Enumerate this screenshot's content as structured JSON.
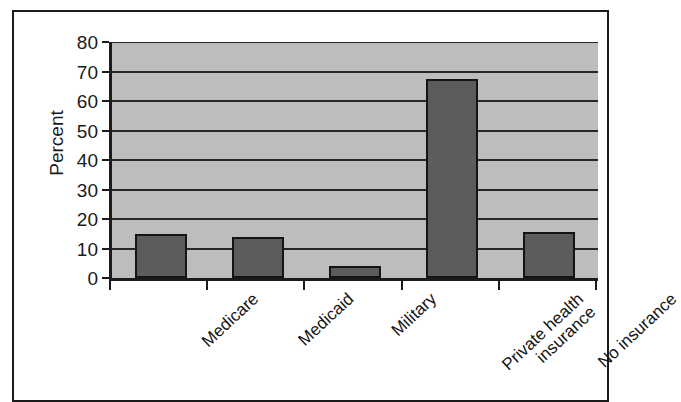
{
  "chart_data": {
    "type": "bar",
    "title": "",
    "xlabel": "",
    "ylabel": "Percent",
    "categories": [
      "Medicare",
      "Medicaid",
      "Military",
      "Private health\ninsurance",
      "No insurance"
    ],
    "values": [
      15,
      14,
      4,
      67.5,
      15.5
    ],
    "ylim": [
      0,
      80
    ],
    "yticks": [
      0,
      10,
      20,
      30,
      40,
      50,
      60,
      70,
      80
    ],
    "ytick_labels": [
      "0",
      "10",
      "20",
      "30",
      "40",
      "50",
      "60",
      "70",
      "80"
    ],
    "grid": true,
    "grid_axis": "y",
    "legend": false,
    "legend_position": "none",
    "bar_color": "#5c5c5c",
    "bar_edge_color": "#141414",
    "plot_background": "#bdbdbd",
    "gridline_color": "#262626",
    "frame_color": "#1b1b1b",
    "page_background": "#ffffff"
  }
}
